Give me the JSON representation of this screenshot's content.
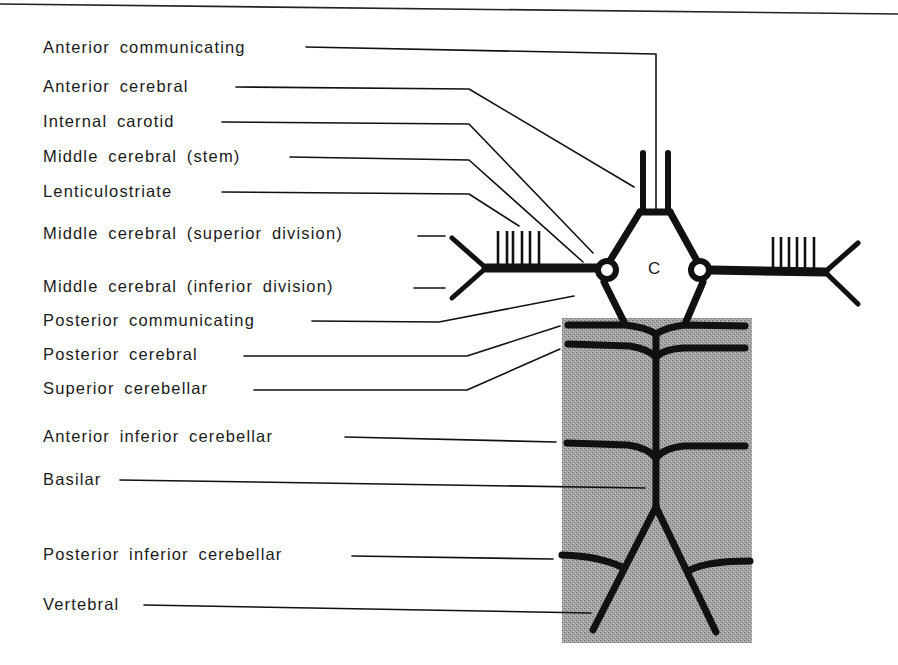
{
  "diagram": {
    "center_label": "C",
    "labels": [
      {
        "id": "anterior-communicating",
        "text": "Anterior communicating"
      },
      {
        "id": "anterior-cerebral",
        "text": "Anterior cerebral"
      },
      {
        "id": "internal-carotid",
        "text": "Internal carotid"
      },
      {
        "id": "middle-cerebral-stem",
        "text": "Middle cerebral (stem)"
      },
      {
        "id": "lenticulostriate",
        "text": "Lenticulostriate"
      },
      {
        "id": "middle-cerebral-superior",
        "text": "Middle cerebral (superior division)"
      },
      {
        "id": "middle-cerebral-inferior",
        "text": "Middle cerebral (inferior division)"
      },
      {
        "id": "posterior-communicating",
        "text": "Posterior communicating"
      },
      {
        "id": "posterior-cerebral",
        "text": "Posterior cerebral"
      },
      {
        "id": "superior-cerebellar",
        "text": "Superior cerebellar"
      },
      {
        "id": "anterior-inferior-cerebellar",
        "text": "Anterior inferior cerebellar"
      },
      {
        "id": "basilar",
        "text": "Basilar"
      },
      {
        "id": "posterior-inferior-cerebellar",
        "text": "Posterior inferior cerebellar"
      },
      {
        "id": "vertebral",
        "text": "Vertebral"
      }
    ],
    "colors": {
      "ink": "#111111",
      "brainstem_fill": "#9a9a9a",
      "background": "#ffffff"
    }
  }
}
